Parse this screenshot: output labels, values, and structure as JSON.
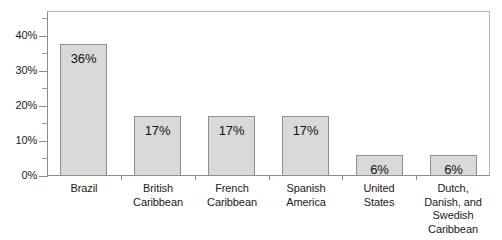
{
  "chart_data": {
    "type": "bar",
    "title": "",
    "subtitle": "",
    "xlabel": "",
    "ylabel": "",
    "categories": [
      "Brazil",
      "British\nCaribbean",
      "French\nCaribbean",
      "Spanish\nAmerica",
      "United\nStates",
      "Dutch,\nDanish, and\nSwedish\nCaribbean"
    ],
    "values": [
      36,
      17,
      17,
      17,
      6,
      6
    ],
    "bar_draw_values": [
      37.5,
      17,
      17,
      17,
      6,
      6
    ],
    "data_labels": [
      "36%",
      "17%",
      "17%",
      "17%",
      "6%",
      "6%"
    ],
    "ylim": [
      0,
      47
    ],
    "y_ticks_major": [
      0,
      10,
      20,
      30,
      40
    ],
    "y_tick_labels": [
      "0%",
      "10%",
      "20%",
      "30%",
      "40%"
    ],
    "y_ticks_minor": [
      5,
      15,
      25,
      35,
      45
    ],
    "grid": false,
    "legend": false,
    "legend_position": "none",
    "colors": {
      "bar_fill": "#d9d9d9",
      "bar_border": "#8f8f8f",
      "axis": "#8c8c8c",
      "frame": "#b5b5b5",
      "text": "#1a1a1a",
      "background": "#ffffff"
    }
  }
}
